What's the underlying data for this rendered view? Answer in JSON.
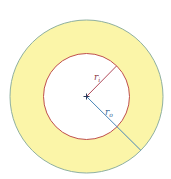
{
  "diagram": {
    "type": "annulus",
    "center": {
      "x": 86.5,
      "y": 96.5
    },
    "outer_circle": {
      "radius": 76.5,
      "fill": "#fbf5a8",
      "stroke": "#8fb0a0"
    },
    "inner_circle": {
      "radius": 43,
      "fill": "#ffffff",
      "stroke": "#c0504d"
    },
    "radii": [
      {
        "name": "inner-radius",
        "label": "r",
        "subscript": "i",
        "color": "#b04a5a",
        "end": {
          "x": 116.5,
          "y": 66
        }
      },
      {
        "name": "outer-radius",
        "label": "r",
        "subscript": "o",
        "color": "#4a86b8",
        "end": {
          "x": 141,
          "y": 150.5
        }
      }
    ],
    "center_mark": "+"
  },
  "labels": {
    "ri_main": "r",
    "ri_sub": "i",
    "ro_main": "r",
    "ro_sub": "o"
  }
}
